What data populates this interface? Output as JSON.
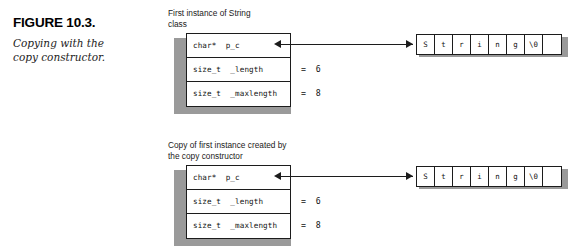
{
  "figure": {
    "number": "FIGURE 10.3.",
    "caption": "Copying with the copy constructor."
  },
  "diagrams": [
    {
      "id": "first-instance",
      "label": "First instance of String\nclass",
      "struct_rows": [
        {
          "field": "char*  p_c",
          "value": ""
        },
        {
          "field": "size_t  _length",
          "value": "=  6"
        },
        {
          "field": "size_t  _maxlength",
          "value": "=  8"
        }
      ],
      "char_array": [
        "S",
        "t",
        "r",
        "i",
        "n",
        "g",
        "\\0",
        ""
      ]
    },
    {
      "id": "copy-instance",
      "label": "Copy of first instance created by\nthe copy constructor",
      "struct_rows": [
        {
          "field": "char*  p_c",
          "value": ""
        },
        {
          "field": "size_t  _length",
          "value": "=  6"
        },
        {
          "field": "size_t  _maxlength",
          "value": "=  8"
        }
      ],
      "char_array": [
        "S",
        "t",
        "r",
        "i",
        "n",
        "g",
        "\\0",
        ""
      ]
    }
  ],
  "colors": {
    "line": "#1c1c1c",
    "shadow": "#9a9a9a",
    "background": "#ffffff",
    "text": "#111111"
  }
}
